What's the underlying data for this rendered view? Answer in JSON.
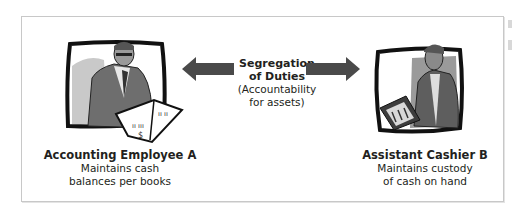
{
  "diagram": {
    "center": {
      "title_line1": "Segregation",
      "title_line2": "of Duties",
      "subtitle_line1": "(Accountability",
      "subtitle_line2": "for assets)"
    },
    "left": {
      "title": "Accounting Employee A",
      "desc_line1": "Maintains cash",
      "desc_line2": "balances per books",
      "illustration": "man-reading-ledger-book"
    },
    "right": {
      "title": "Assistant Cashier B",
      "desc_line1": "Maintains custody",
      "desc_line2": "of cash on hand",
      "illustration": "man-holding-cash-tray"
    },
    "colors": {
      "arrow": "#4a4a4a",
      "frame_border": "#c8c8c8",
      "text": "#231f20"
    }
  }
}
